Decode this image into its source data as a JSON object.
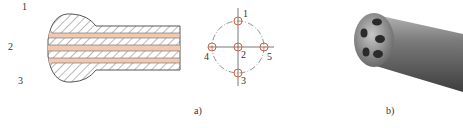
{
  "figure": {
    "panel_a": {
      "caption": "a)",
      "cross_section": {
        "channel_labels": [
          "1",
          "2",
          "3"
        ]
      },
      "hole_layout": {
        "hole_labels": [
          "1",
          "2",
          "3",
          "4",
          "5"
        ]
      }
    },
    "panel_b": {
      "caption": "b)"
    },
    "colors": {
      "channel_fill": "#f2c9b0",
      "hole_marker": "#d9603a",
      "hatch": "#555555",
      "probe_dark": "#4a4a4a",
      "probe_light": "#9a9a9a"
    }
  }
}
